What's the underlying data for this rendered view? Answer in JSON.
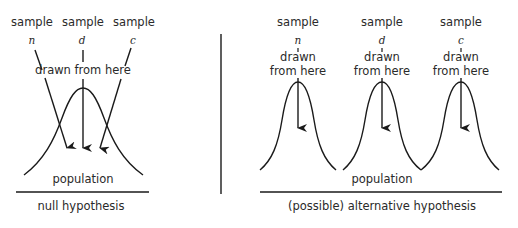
{
  "null_panel": {
    "samples": [
      {
        "label": "sample",
        "var": "n"
      },
      {
        "label": "sample",
        "var": "d"
      },
      {
        "label": "sample",
        "var": "c"
      }
    ],
    "drawn_label": "drawn from here",
    "population_label": "population",
    "caption": "null hypothesis"
  },
  "alt_panel": {
    "samples": [
      {
        "label": "sample",
        "var": "n",
        "drawn_line1": "drawn",
        "drawn_line2": "from here"
      },
      {
        "label": "sample",
        "var": "d",
        "drawn_line1": "drawn",
        "drawn_line2": "from here"
      },
      {
        "label": "sample",
        "var": "c",
        "drawn_line1": "drawn",
        "drawn_line2": "from here"
      }
    ],
    "population_label": "population",
    "caption": "(possible) alternative hypothesis"
  },
  "colors": {
    "stroke": "#1a1a1a",
    "text": "#2a2a2a",
    "background": "#ffffff"
  }
}
